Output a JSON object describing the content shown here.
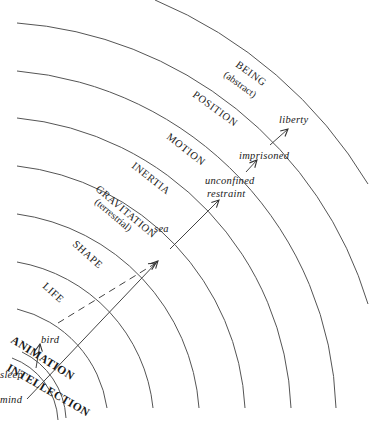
{
  "diagram": {
    "type": "concentric-arcs-category-hierarchy",
    "levels": [
      {
        "name": "INTELLECTION",
        "qualifier": ""
      },
      {
        "name": "ANIMATION",
        "qualifier": ""
      },
      {
        "name": "LIFE",
        "qualifier": ""
      },
      {
        "name": "SHAPE",
        "qualifier": ""
      },
      {
        "name": "GRAVITATION",
        "qualifier": "(terrestrial)"
      },
      {
        "name": "INERTIA",
        "qualifier": ""
      },
      {
        "name": "MOTION",
        "qualifier": ""
      },
      {
        "name": "POSITION",
        "qualifier": ""
      },
      {
        "name": "BEING",
        "qualifier": "(abstract)"
      }
    ],
    "items": {
      "mind": "mind",
      "sleep": "sleep",
      "bird": "bird",
      "sea": "sea",
      "unconfined": "unconfined",
      "restraint": "restraint",
      "imprisoned": "imprisoned",
      "liberty": "liberty"
    },
    "arrows": [
      {
        "from": "mind",
        "to": "sea",
        "style": "solid"
      },
      {
        "from": "sleep",
        "to": "bird",
        "style": "solid"
      },
      {
        "from": "bird",
        "to": "sea",
        "style": "dashed"
      },
      {
        "from": "sea",
        "to": "restraint",
        "style": "solid"
      },
      {
        "from": "restraint",
        "to": "imprisoned",
        "style": "solid"
      },
      {
        "from": "imprisoned",
        "to": "liberty",
        "style": "solid"
      }
    ],
    "colors": {
      "line": "#555555",
      "text": "#1a1a1a",
      "background": "#ffffff"
    }
  }
}
